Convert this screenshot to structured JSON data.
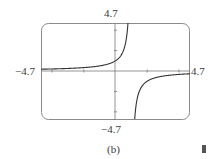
{
  "chart_data": {
    "type": "line",
    "title": "",
    "function": "y = 1/(1 - x)",
    "xlabel": "",
    "ylabel": "",
    "xlim": [
      -4.7,
      4.7
    ],
    "ylim": [
      -4.7,
      4.7
    ],
    "x_tick_spacing": 2,
    "y_tick_spacing": 2,
    "vertical_asymptote": 1,
    "horizontal_asymptote": 0,
    "grid": false,
    "frame": "rounded-rectangle",
    "series": [
      {
        "name": "left branch",
        "x": [
          -4.7,
          -4,
          -3,
          -2,
          -1,
          0,
          0.5,
          0.79
        ],
        "y": [
          0.18,
          0.2,
          0.25,
          0.33,
          0.5,
          1,
          2,
          4.7
        ]
      },
      {
        "name": "right branch",
        "x": [
          1.21,
          1.5,
          2,
          3,
          4,
          4.7
        ],
        "y": [
          -4.7,
          -2,
          -1,
          -0.5,
          -0.33,
          -0.27
        ]
      }
    ],
    "tick_labels": {
      "x_min": "−4.7",
      "x_max": "4.7",
      "y_min": "−4.7",
      "y_max": "4.7"
    }
  },
  "labels": {
    "top": "4.7",
    "bottom": "−4.7",
    "left": "−4.7",
    "right": "4.7",
    "caption": "(b)"
  }
}
